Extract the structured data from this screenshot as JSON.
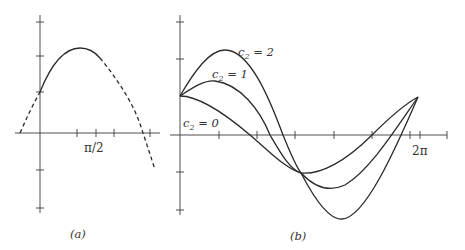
{
  "figure": {
    "panel_a": {
      "caption": "(a)",
      "x_tick_label": "π/2",
      "curve_solid": "solid arc from y-axis intercept through peak",
      "curve_dashed": "dashed continuation on both ends"
    },
    "panel_b": {
      "caption": "(b)",
      "x_tick_label": "2π",
      "curve_labels": [
        {
          "var": "c",
          "sub": "2",
          "rest": " = 2"
        },
        {
          "var": "c",
          "sub": "2",
          "rest": " = 1"
        },
        {
          "var": "c",
          "sub": "2",
          "rest": " = 0"
        }
      ]
    }
  },
  "colors": {
    "line": "#2a2a2a",
    "axis": "#3a3a3a",
    "background": "#ffffff"
  }
}
